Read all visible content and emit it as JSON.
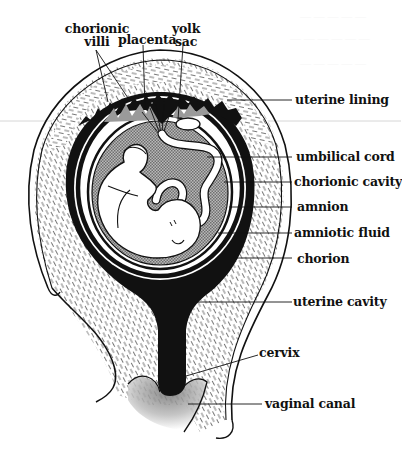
{
  "figure": {
    "type": "anatomical-diagram",
    "colors": {
      "ink": "#111111",
      "background": "#ffffff",
      "fluid_stipple": "#9a9a9a",
      "scan_line": "#d6d6d6"
    }
  },
  "labels": {
    "top": [
      {
        "id": "chorionic-villi",
        "line1": "chorionic",
        "line2": "villi"
      },
      {
        "id": "placenta",
        "line1": "placenta"
      },
      {
        "id": "yolk-sac",
        "line1": "yolk",
        "line2": "sac"
      }
    ],
    "right": [
      {
        "id": "uterine-lining",
        "text": "uterine lining"
      },
      {
        "id": "umbilical-cord",
        "text": "umbilical cord"
      },
      {
        "id": "chorionic-cavity",
        "text": "chorionic cavity"
      },
      {
        "id": "amnion",
        "text": "amnion"
      },
      {
        "id": "amniotic-fluid",
        "text": "amniotic fluid"
      },
      {
        "id": "chorion",
        "text": "chorion"
      },
      {
        "id": "uterine-cavity",
        "text": "uterine cavity"
      },
      {
        "id": "cervix",
        "text": "cervix"
      },
      {
        "id": "vaginal-canal",
        "text": "vaginal canal"
      }
    ]
  }
}
